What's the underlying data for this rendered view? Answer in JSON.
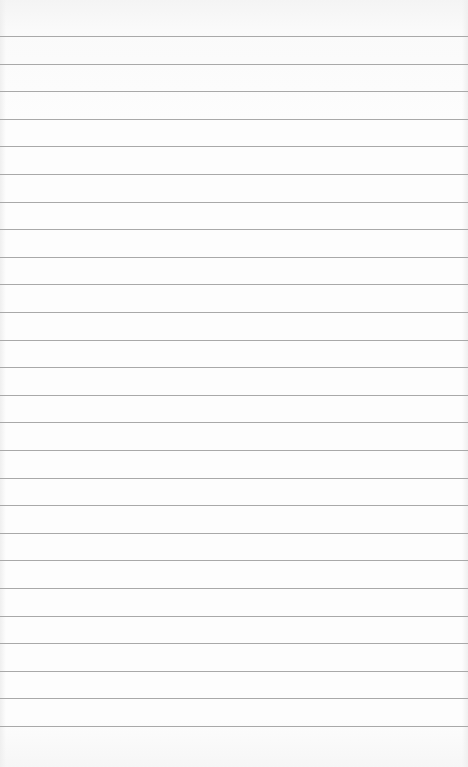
{
  "page": {
    "background_color": "#fdfdfd",
    "rule_color": "#a9a9a9",
    "rule_count": 26,
    "first_rule_y": 36,
    "rule_spacing": 27.6
  }
}
